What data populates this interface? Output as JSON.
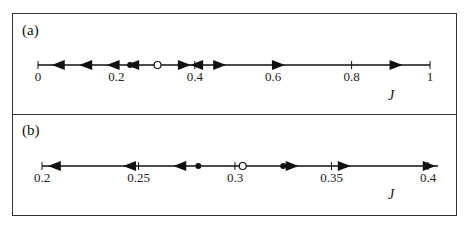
{
  "panels": [
    {
      "id": "a",
      "label": "(a)",
      "axis_label": "J",
      "axis": {
        "min": 0,
        "max": 1,
        "x0": 38,
        "x1": 430,
        "y": 65
      },
      "ticks": [
        {
          "v": 0,
          "t": "0"
        },
        {
          "v": 0.2,
          "t": "0.2"
        },
        {
          "v": 0.4,
          "t": "0.4"
        },
        {
          "v": 0.6,
          "t": "0.6"
        },
        {
          "v": 0.8,
          "t": "0.8"
        },
        {
          "v": 1,
          "t": "1"
        }
      ],
      "arrows_left": [
        0.035,
        0.105,
        0.175,
        0.225
      ],
      "arrows_right": [
        0.39,
        0.48,
        0.63,
        0.93
      ],
      "arrow_left_extra": [
        0.388
      ],
      "filled_points": [
        0.235,
        0.365
      ],
      "open_points": [
        0.305
      ]
    },
    {
      "id": "b",
      "label": "(b)",
      "axis_label": "J",
      "axis": {
        "min": 0.2,
        "max": 0.4,
        "x0": 42,
        "x1": 428,
        "y": 166
      },
      "ticks": [
        {
          "v": 0.2,
          "t": "0.2"
        },
        {
          "v": 0.25,
          "t": "0.25"
        },
        {
          "v": 0.3,
          "t": "0.3"
        },
        {
          "v": 0.35,
          "t": "0.35"
        },
        {
          "v": 0.4,
          "t": "0.4"
        }
      ],
      "arrows_left": [
        0.203,
        0.242,
        0.268
      ],
      "arrows_right": [
        0.333,
        0.36,
        0.404
      ],
      "arrow_left_extra": [],
      "filled_points": [
        0.281,
        0.325
      ],
      "open_points": [
        0.304
      ]
    }
  ],
  "chart_data": {
    "type": "phase-line",
    "title": "",
    "panels": [
      {
        "label": "(a)",
        "xlabel": "J",
        "xlim": [
          0,
          1
        ],
        "ticks": [
          0,
          0.2,
          0.4,
          0.6,
          0.8,
          1
        ],
        "stable_fixed_points": [
          0.235,
          0.365
        ],
        "unstable_fixed_points": [
          0.305
        ],
        "flow": [
          {
            "range": [
              0,
              0.235
            ],
            "direction": "left"
          },
          {
            "range": [
              0.235,
              0.305
            ],
            "direction": "none"
          },
          {
            "range": [
              0.365,
              1
            ],
            "direction": "right"
          }
        ]
      },
      {
        "label": "(b)",
        "xlabel": "J",
        "xlim": [
          0.2,
          0.4
        ],
        "ticks": [
          0.2,
          0.25,
          0.3,
          0.35,
          0.4
        ],
        "stable_fixed_points": [
          0.281,
          0.325
        ],
        "unstable_fixed_points": [
          0.304
        ],
        "flow": [
          {
            "range": [
              0.2,
              0.281
            ],
            "direction": "left"
          },
          {
            "range": [
              0.325,
              0.4
            ],
            "direction": "right"
          }
        ]
      }
    ]
  }
}
